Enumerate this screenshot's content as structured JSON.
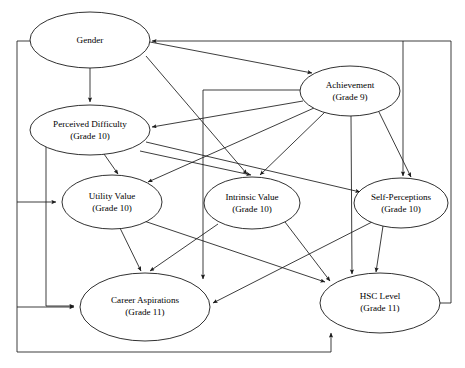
{
  "diagram": {
    "type": "path-diagram",
    "stroke_color": "#1a1a1a",
    "node_fill": "#ffffff",
    "nodes": [
      {
        "id": "gender",
        "label_line1": "Gender",
        "label_line2": "",
        "cx": 90,
        "cy": 40,
        "rx": 60,
        "ry": 28
      },
      {
        "id": "achievement",
        "label_line1": "Achievement",
        "label_line2": "(Grade 9)",
        "cx": 350,
        "cy": 91,
        "rx": 50,
        "ry": 25
      },
      {
        "id": "perceived_difficulty",
        "label_line1": "Perceived Difficulty",
        "label_line2": "(Grade 10)",
        "cx": 90,
        "cy": 130,
        "rx": 60,
        "ry": 25
      },
      {
        "id": "utility_value",
        "label_line1": "Utility Value",
        "label_line2": "(Grade 10)",
        "cx": 112,
        "cy": 202,
        "rx": 50,
        "ry": 27
      },
      {
        "id": "intrinsic_value",
        "label_line1": "Intrinsic Value",
        "label_line2": "(Grade 10)",
        "cx": 252,
        "cy": 203,
        "rx": 48,
        "ry": 26
      },
      {
        "id": "self_perceptions",
        "label_line1": "Self-Perceptions",
        "label_line2": "(Grade 10)",
        "cx": 401,
        "cy": 203,
        "rx": 47,
        "ry": 25
      },
      {
        "id": "career_aspirations",
        "label_line1": "Career Aspirations",
        "label_line2": "(Grade 11)",
        "cx": 145,
        "cy": 307,
        "rx": 65,
        "ry": 34
      },
      {
        "id": "hsc_level",
        "label_line1": "HSC Level",
        "label_line2": "(Grade 11)",
        "cx": 380,
        "cy": 303,
        "rx": 60,
        "ry": 30
      }
    ],
    "edges": [
      {
        "from": "gender",
        "to": "perceived_difficulty"
      },
      {
        "from": "gender",
        "to": "achievement"
      },
      {
        "from": "gender",
        "to": "intrinsic_value"
      },
      {
        "from": "gender",
        "to": "utility_value"
      },
      {
        "from": "gender",
        "to": "career_aspirations"
      },
      {
        "from": "achievement",
        "to": "perceived_difficulty"
      },
      {
        "from": "achievement",
        "to": "utility_value"
      },
      {
        "from": "achievement",
        "to": "intrinsic_value"
      },
      {
        "from": "achievement",
        "to": "self_perceptions"
      },
      {
        "from": "achievement",
        "to": "hsc_level"
      },
      {
        "from": "achievement",
        "to": "career_aspirations"
      },
      {
        "from": "perceived_difficulty",
        "to": "utility_value"
      },
      {
        "from": "perceived_difficulty",
        "to": "intrinsic_value"
      },
      {
        "from": "perceived_difficulty",
        "to": "self_perceptions"
      },
      {
        "from": "perceived_difficulty",
        "to": "career_aspirations"
      },
      {
        "from": "utility_value",
        "to": "career_aspirations"
      },
      {
        "from": "utility_value",
        "to": "hsc_level"
      },
      {
        "from": "intrinsic_value",
        "to": "career_aspirations"
      },
      {
        "from": "intrinsic_value",
        "to": "hsc_level"
      },
      {
        "from": "self_perceptions",
        "to": "career_aspirations"
      },
      {
        "from": "self_perceptions",
        "to": "hsc_level"
      },
      {
        "from": "career_aspirations",
        "to": "hsc_level"
      },
      {
        "from": "hsc_level",
        "to": "gender"
      }
    ]
  }
}
